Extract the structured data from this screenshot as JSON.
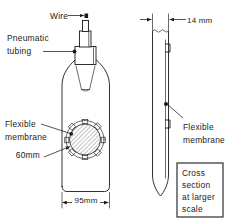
{
  "figure": {
    "type": "technical-line-drawing",
    "background_color": "#ffffff",
    "line_color": "#1a1a1a"
  },
  "labels": {
    "wire": "Wire",
    "pneumatic_tubing_line1": "Pneumatic",
    "pneumatic_tubing_line2": "tubing",
    "flexible_membrane_left_line1": "Flexible",
    "flexible_membrane_left_line2": "membrane",
    "flexible_membrane_right_line1": "Flexible",
    "flexible_membrane_right_line2": "membrane"
  },
  "dimensions": {
    "membrane_diameter": "60mm",
    "body_width": "95mm",
    "section_thickness": "14 mm"
  },
  "note_box": {
    "line1": "Cross",
    "line2": "section",
    "line3": "at larger",
    "line4": "scale"
  },
  "membrane_detail": {
    "bolt_count": 8,
    "hatch_pattern": "diagonal-cross-hatch"
  }
}
